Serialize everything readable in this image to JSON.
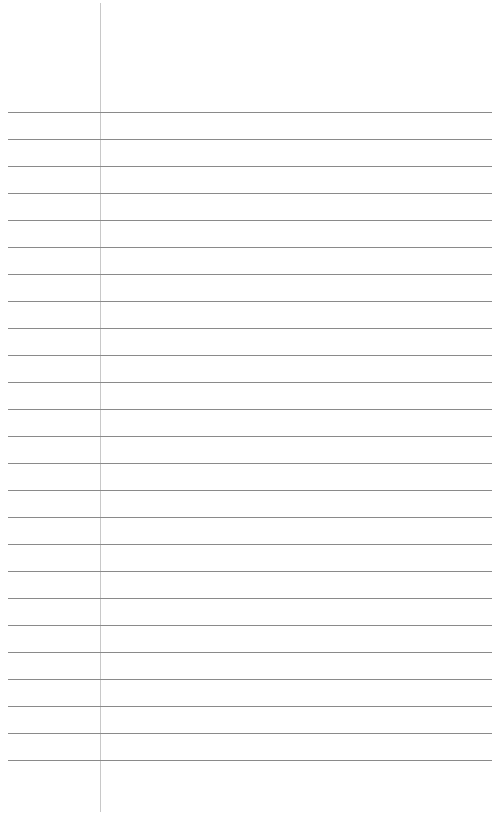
{
  "page": {
    "type": "lined-paper",
    "rule_count": 25,
    "first_rule_y": 112,
    "rule_spacing": 27,
    "rule_color": "#8a8a8a",
    "margin_color": "#c8c8c8",
    "margin_x": 100
  }
}
